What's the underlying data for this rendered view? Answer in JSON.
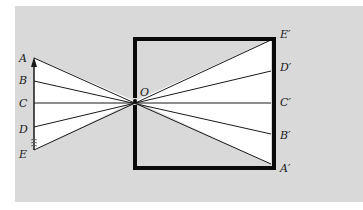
{
  "diagram": {
    "type": "pinhole-camera",
    "colors": {
      "panel": "#d9d9d9",
      "light": "#ffffff",
      "box": "#0a0a0a",
      "ray": "#1a1a1a"
    },
    "pinhole_label": "O",
    "object_labels": [
      "A",
      "B",
      "C",
      "D",
      "E"
    ],
    "image_labels": [
      "E′",
      "D′",
      "C′",
      "B′",
      "A′"
    ]
  }
}
